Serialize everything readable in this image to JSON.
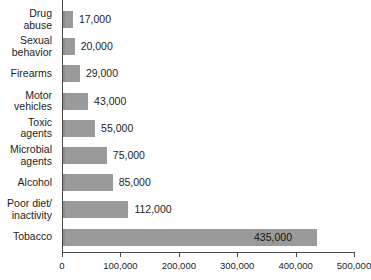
{
  "chart_data": {
    "type": "bar",
    "orientation": "horizontal",
    "title": "",
    "xlabel": "",
    "ylabel": "",
    "xlim": [
      0,
      500000
    ],
    "grid": false,
    "legend": null,
    "categories": [
      "Drug\nabuse",
      "Sexual\nbehavior",
      "Firearms",
      "Motor\nvehicles",
      "Toxic\nagents",
      "Microbial\nagents",
      "Alcohol",
      "Poor diet/\ninactivity",
      "Tobacco"
    ],
    "values": [
      17000,
      20000,
      29000,
      43000,
      55000,
      75000,
      85000,
      112000,
      435000
    ],
    "value_labels": [
      "17,000",
      "20,000",
      "29,000",
      "43,000",
      "55,000",
      "75,000",
      "85,000",
      "112,000",
      "435,000"
    ],
    "label_placement": [
      "outside",
      "outside",
      "outside",
      "outside",
      "outside",
      "outside",
      "outside",
      "outside",
      "inside"
    ],
    "xticks": [
      0,
      100000,
      200000,
      300000,
      400000,
      500000
    ],
    "xtick_labels": [
      "0",
      "100,000",
      "200,000",
      "300,000",
      "400,000",
      "500,000"
    ],
    "bar_color": "#9a9a9a",
    "axis_color": "#4a4a4a",
    "background_color": "#ffffff"
  }
}
